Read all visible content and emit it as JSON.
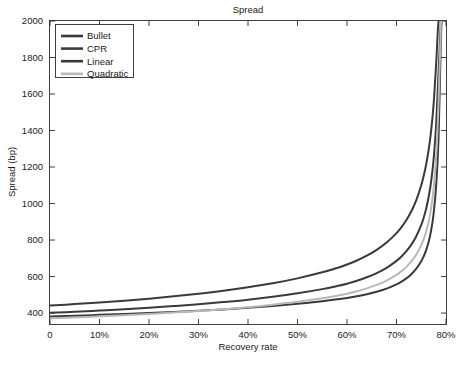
{
  "figure": {
    "title": "Spread",
    "background": "#ffffff",
    "axes_color": "#2b2b2b"
  },
  "chart_data": {
    "type": "line",
    "title": "Spread",
    "xlabel": "Recovery rate",
    "ylabel": "Spread (bp)",
    "xlim": [
      0,
      80
    ],
    "ylim": [
      340,
      2000
    ],
    "grid": false,
    "legend_position": "upper left",
    "xticks": [
      0,
      10,
      20,
      30,
      40,
      50,
      60,
      70,
      80
    ],
    "xticklabels": [
      "0",
      "10%",
      "20%",
      "30%",
      "40%",
      "50%",
      "60%",
      "70%",
      "80%"
    ],
    "yticks": [
      400,
      600,
      800,
      1000,
      1200,
      1400,
      1600,
      1800,
      2000
    ],
    "yticklabels": [
      "400",
      "600",
      "800",
      "1000",
      "1200",
      "1400",
      "1600",
      "1800",
      "2000"
    ],
    "x": [
      0,
      5,
      10,
      15,
      20,
      25,
      30,
      35,
      40,
      45,
      50,
      55,
      58,
      60,
      62,
      64,
      66,
      68,
      70,
      71,
      72,
      73,
      74,
      75,
      75.5,
      76,
      76.5,
      77,
      77.5,
      78,
      78.5,
      79,
      79.3
    ],
    "series": [
      {
        "name": "Bullet",
        "color": "#3a3a3a",
        "width": 2.0,
        "values": [
          441,
          449,
          458,
          468,
          479,
          492,
          506,
          522,
          541,
          563,
          590,
          623,
          647,
          666,
          688,
          714,
          746,
          786,
          838,
          871,
          910,
          958,
          1019,
          1100,
          1152,
          1215,
          1295,
          1400,
          1545,
          1760,
          2000,
          2000,
          2000
        ]
      },
      {
        "name": "CPR",
        "color": "#3a3a3a",
        "width": 2.0,
        "values": [
          401,
          407,
          414,
          421,
          429,
          438,
          448,
          460,
          473,
          489,
          508,
          531,
          548,
          561,
          577,
          596,
          619,
          648,
          686,
          710,
          739,
          775,
          821,
          883,
          923,
          973,
          1037,
          1122,
          1243,
          1426,
          1720,
          2000,
          2000
        ]
      },
      {
        "name": "Linear",
        "color": "#3a3a3a",
        "width": 2.0,
        "values": [
          381,
          385,
          390,
          395,
          400,
          406,
          413,
          420,
          429,
          439,
          451,
          465,
          475,
          483,
          492,
          503,
          517,
          534,
          557,
          572,
          590,
          613,
          643,
          684,
          711,
          746,
          791,
          853,
          945,
          1093,
          1360,
          1930,
          2000
        ]
      },
      {
        "name": "Quadratic",
        "color": "#b9b9b9",
        "width": 2.0,
        "values": [
          371,
          376,
          382,
          388,
          395,
          403,
          411,
          421,
          432,
          446,
          462,
          481,
          495,
          506,
          519,
          535,
          554,
          578,
          609,
          629,
          653,
          683,
          721,
          772,
          805,
          847,
          901,
          975,
          1082,
          1252,
          1550,
          2000,
          2000
        ]
      }
    ]
  },
  "legend": {
    "entries": [
      {
        "label": "Bullet"
      },
      {
        "label": "CPR"
      },
      {
        "label": "Linear"
      },
      {
        "label": "Quadratic"
      }
    ]
  }
}
